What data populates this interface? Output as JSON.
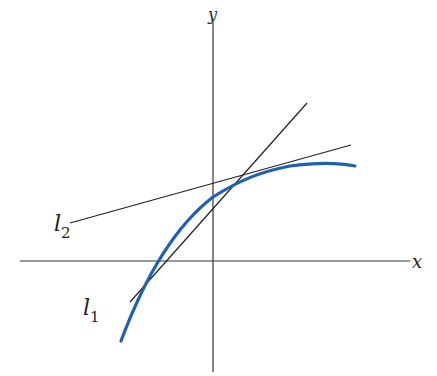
{
  "diagram": {
    "axes": {
      "x_label": "x",
      "y_label": "y"
    },
    "lines": [
      {
        "name": "l1",
        "label": "l",
        "subscript": "1"
      },
      {
        "name": "l2",
        "label": "l",
        "subscript": "2"
      }
    ],
    "curve": {
      "color": "#1f5fb4"
    },
    "line_color": "#222222"
  }
}
